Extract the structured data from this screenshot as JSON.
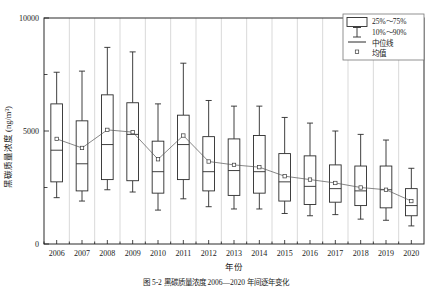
{
  "chart_data": {
    "type": "box",
    "title": "",
    "xlabel": "年份",
    "ylabel": "黑碳质量浓度 (ng/m³)",
    "ylim": [
      0,
      10000
    ],
    "ytick_labels": [
      "0",
      "5000",
      "10000"
    ],
    "ytick_values": [
      0,
      5000,
      10000
    ],
    "yminor_values": [
      2500,
      7500
    ],
    "grid": "vertical",
    "categories": [
      "2006",
      "2007",
      "2008",
      "2009",
      "2010",
      "2011",
      "2012",
      "2013",
      "2014",
      "2015",
      "2016",
      "2017",
      "2018",
      "2019",
      "2020"
    ],
    "box_stats": [
      {
        "year": "2006",
        "p10": 2050,
        "p25": 2750,
        "median": 4150,
        "p75": 6200,
        "p90": 7600,
        "mean": 4650
      },
      {
        "year": "2007",
        "p10": 1900,
        "p25": 2350,
        "median": 3550,
        "p75": 5450,
        "p90": 7650,
        "mean": 4250
      },
      {
        "year": "2008",
        "p10": 2400,
        "p25": 2850,
        "median": 4400,
        "p75": 6600,
        "p90": 8700,
        "mean": 5050
      },
      {
        "year": "2009",
        "p10": 2300,
        "p25": 2800,
        "median": 4850,
        "p75": 6250,
        "p90": 8500,
        "mean": 4950
      },
      {
        "year": "2010",
        "p10": 1500,
        "p25": 2250,
        "median": 3200,
        "p75": 4550,
        "p90": 6200,
        "mean": 3750
      },
      {
        "year": "2011",
        "p10": 2000,
        "p25": 2850,
        "median": 4400,
        "p75": 5700,
        "p90": 8000,
        "mean": 4800
      },
      {
        "year": "2012",
        "p10": 1650,
        "p25": 2350,
        "median": 3200,
        "p75": 4750,
        "p90": 6350,
        "mean": 3650
      },
      {
        "year": "2013",
        "p10": 1550,
        "p25": 2150,
        "median": 3250,
        "p75": 4650,
        "p90": 6100,
        "mean": 3500
      },
      {
        "year": "2014",
        "p10": 1550,
        "p25": 2250,
        "median": 3200,
        "p75": 4800,
        "p90": 6100,
        "mean": 3400
      },
      {
        "year": "2015",
        "p10": 1350,
        "p25": 1900,
        "median": 2750,
        "p75": 4000,
        "p90": 5600,
        "mean": 3000
      },
      {
        "year": "2016",
        "p10": 1250,
        "p25": 1750,
        "median": 2550,
        "p75": 3900,
        "p90": 5350,
        "mean": 2850
      },
      {
        "year": "2017",
        "p10": 1300,
        "p25": 1850,
        "median": 2450,
        "p75": 3500,
        "p90": 5000,
        "mean": 2700
      },
      {
        "year": "2018",
        "p10": 1100,
        "p25": 1700,
        "median": 2350,
        "p75": 3450,
        "p90": 4850,
        "mean": 2500
      },
      {
        "year": "2019",
        "p10": 1050,
        "p25": 1600,
        "median": 2400,
        "p75": 3450,
        "p90": 4600,
        "mean": 2400
      },
      {
        "year": "2020",
        "p10": 800,
        "p25": 1250,
        "median": 1700,
        "p75": 2450,
        "p90": 3350,
        "mean": 1900
      }
    ],
    "mean_series": {
      "name": "均值",
      "values": [
        4650,
        4250,
        5050,
        4950,
        3750,
        4800,
        3650,
        3500,
        3400,
        3000,
        2850,
        2700,
        2500,
        2400,
        1900
      ]
    },
    "legend": {
      "position": "top-right",
      "entries": [
        {
          "key": "box",
          "label": "25%～75%"
        },
        {
          "key": "whisker",
          "label": "10%～90%"
        },
        {
          "key": "median",
          "label": "中位线"
        },
        {
          "key": "mean",
          "label": "均值"
        }
      ]
    }
  },
  "caption": "图 5-2  黑碳质量浓度 2006—2020 年间逐年变化",
  "colors": {
    "line": "#2b2b2b",
    "grid": "#c9c9c9",
    "mean": "#555555",
    "background": "#ffffff"
  }
}
